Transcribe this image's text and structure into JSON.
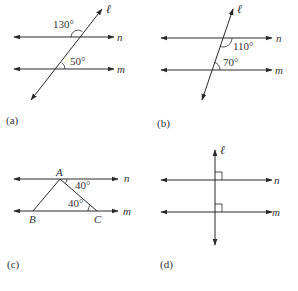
{
  "figures": [
    {
      "id": "a",
      "caption": "(a)",
      "lines": {
        "transversal": "ℓ",
        "upper": "n",
        "lower": "m"
      },
      "angles": [
        {
          "label": "130°",
          "at": "upper intersection, upper-left"
        },
        {
          "label": "50°",
          "at": "lower intersection, upper-right"
        }
      ]
    },
    {
      "id": "b",
      "caption": "(b)",
      "lines": {
        "transversal": "ℓ",
        "upper": "n",
        "lower": "m"
      },
      "angles": [
        {
          "label": "110°",
          "at": "upper intersection, lower-right"
        },
        {
          "label": "70°",
          "at": "lower intersection, upper-right"
        }
      ]
    },
    {
      "id": "c",
      "caption": "(c)",
      "lines": {
        "upper": "n",
        "lower": "m"
      },
      "points": {
        "A": "A",
        "B": "B",
        "C": "C"
      },
      "angles": [
        {
          "label": "40°",
          "at": "vertex A, between AC and n (right)"
        },
        {
          "label": "40°",
          "at": "vertex C, angle ACB"
        }
      ]
    },
    {
      "id": "d",
      "caption": "(d)",
      "lines": {
        "transversal": "ℓ",
        "upper": "n",
        "lower": "m"
      },
      "angles": [
        {
          "label": "right-angle",
          "at": "upper intersection"
        },
        {
          "label": "right-angle",
          "at": "lower intersection"
        }
      ]
    }
  ]
}
